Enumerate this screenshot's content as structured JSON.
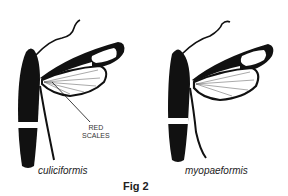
{
  "figure": {
    "caption": "Fig 2",
    "specimens": [
      {
        "name": "culiciformis",
        "annotation": {
          "line1": "RED",
          "line2": "SCALES"
        }
      },
      {
        "name": "myopaeformis"
      }
    ]
  }
}
